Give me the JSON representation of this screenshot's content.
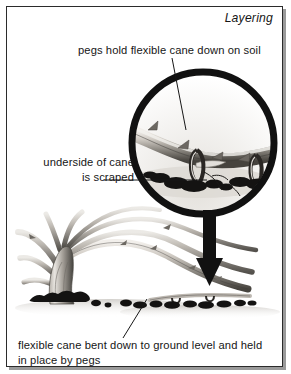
{
  "figure": {
    "title": "Layering",
    "domain_subject": "horticulture-propagation-diagram",
    "background_color": "#ffffff",
    "ink_color": "#161616",
    "frame_color": "#2b2b2b",
    "shadow_color": "#9a9a9a"
  },
  "captions": {
    "top": "pegs hold flexible cane down on soil",
    "left": "underside of cane\nis scraped",
    "bottom": "flexible cane bent down to ground level and held\nin place by pegs"
  },
  "illustration": {
    "magnifier": {
      "name": "magnified-detail-circle",
      "center_x": 203,
      "center_y": 143,
      "radius": 74,
      "ring_width": 7,
      "ring_color": "#111111"
    },
    "arrow": {
      "name": "down-arrow",
      "from_y": 214,
      "to_y": 284,
      "x": 209,
      "color": "#111111"
    },
    "leader_lines": [
      {
        "name": "leader-top",
        "x1": 172,
        "y1": 58,
        "x2": 186,
        "y2": 128
      },
      {
        "name": "leader-left",
        "x1": 104,
        "y1": 180,
        "x2": 207,
        "y2": 180
      },
      {
        "name": "leader-bottom",
        "x1": 123,
        "y1": 336,
        "x2": 146,
        "y2": 300
      }
    ],
    "plant": {
      "name": "bramble-cane-plant",
      "base_x": 62,
      "ground_y": 305,
      "cane_color_light": "#d8d4ce",
      "cane_color_dark": "#4c4944",
      "soil_color": "#1d1c1a"
    },
    "pegs_in_detail": 2
  }
}
